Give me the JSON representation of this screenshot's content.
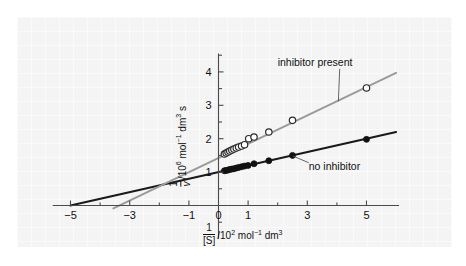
{
  "figure": {
    "background_color": "#f4f4f4",
    "page_color": "#ffffff"
  },
  "annotations": {
    "inhibitor_present": "inhibitor present",
    "no_inhibitor": "no inhibitor"
  },
  "axis_labels": {
    "x_numerator": "1",
    "x_denominator": "[S]",
    "x_units_pre": "/10",
    "x_units_exp": "2",
    "x_units_mid": " mol",
    "x_units_exp2": "−1",
    "x_units_post": " dm",
    "x_units_exp3": "3",
    "y_numerator": "1",
    "y_denominator": "v",
    "y_units_pre": "/10",
    "y_units_exp": "6",
    "y_units_mid": " mol",
    "y_units_exp2": "−1",
    "y_units_post": " dm",
    "y_units_exp3": "3",
    "y_units_tail": " s"
  },
  "chart_data": {
    "type": "scatter",
    "title": "",
    "xlabel": "1/[S] /10^2 mol^-1 dm^3",
    "ylabel": "1/v /10^6 mol^-1 dm^3 s",
    "xlim": [
      -5.6,
      6.1
    ],
    "ylim": [
      -1.0,
      4.55
    ],
    "grid": false,
    "legend_position": "inline-annotations",
    "xticks": [
      -5,
      -3,
      -1,
      0,
      1,
      3,
      5
    ],
    "xtick_labels": [
      "−5",
      "−3",
      "−1",
      "0",
      "1",
      "3",
      "5"
    ],
    "xminorticks": [
      -4,
      -2,
      2,
      4
    ],
    "yticks": [
      1,
      2,
      3,
      4
    ],
    "ytick_labels": [
      "1",
      "2",
      "3",
      "4"
    ],
    "yminorticks": [
      -0.5,
      0.5,
      1.5,
      2.5,
      3.5,
      4.5
    ],
    "series": [
      {
        "name": "no inhibitor",
        "marker": "filled-circle",
        "color": "#111111",
        "line_color": "#1a1a1a",
        "fit_intercept": 1.0,
        "fit_slope": 0.2,
        "fit_x_range": [
          -5.0,
          6.0
        ],
        "x_intercept": -5.0,
        "points_x": [
          0.2,
          0.26,
          0.32,
          0.38,
          0.45,
          0.52,
          0.6,
          0.68,
          0.78,
          0.88,
          1.0,
          1.2,
          1.7,
          2.5,
          5.0
        ],
        "points_y": [
          1.04,
          1.05,
          1.06,
          1.08,
          1.09,
          1.1,
          1.12,
          1.14,
          1.16,
          1.18,
          1.2,
          1.25,
          1.34,
          1.5,
          1.98
        ]
      },
      {
        "name": "inhibitor present",
        "marker": "open-circle",
        "color": "#ffffff",
        "line_color": "#9a9a9a",
        "fit_intercept": 1.42,
        "fit_slope": 0.425,
        "fit_x_range": [
          -3.55,
          6.0
        ],
        "x_intercept": -3.55,
        "points_x": [
          0.2,
          0.26,
          0.32,
          0.38,
          0.45,
          0.52,
          0.6,
          0.68,
          0.78,
          0.88,
          1.02,
          1.2,
          1.7,
          2.5,
          5.0
        ],
        "points_y": [
          1.54,
          1.57,
          1.6,
          1.63,
          1.66,
          1.69,
          1.72,
          1.75,
          1.78,
          1.82,
          2.0,
          2.05,
          2.2,
          2.55,
          3.52
        ]
      }
    ],
    "annotation_leaders": [
      {
        "label": "inhibitor present",
        "text_x": 2.0,
        "text_y": 4.18,
        "target_x": 4.05,
        "target_y": 3.12
      },
      {
        "label": "no inhibitor",
        "text_x": 3.05,
        "text_y": 1.07,
        "target_x": 2.52,
        "target_y": 1.48
      }
    ]
  }
}
